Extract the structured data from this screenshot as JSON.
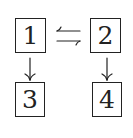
{
  "diagram": {
    "nodes": [
      {
        "id": "n1",
        "label": "1",
        "x": 15,
        "y": 18,
        "w": 31,
        "h": 35
      },
      {
        "id": "n2",
        "label": "2",
        "x": 90,
        "y": 18,
        "w": 31,
        "h": 35
      },
      {
        "id": "n3",
        "label": "3",
        "x": 15,
        "y": 82,
        "w": 30,
        "h": 35
      },
      {
        "id": "n4",
        "label": "4",
        "x": 92,
        "y": 82,
        "w": 30,
        "h": 35
      }
    ],
    "edges": [
      {
        "from": "2",
        "to": "1",
        "type": "arrow-left",
        "note": "upper arrow of ⇆"
      },
      {
        "from": "1",
        "to": "2",
        "type": "arrow-right",
        "note": "lower arrow of ⇆"
      },
      {
        "from": "1",
        "to": "3",
        "type": "arrow-down"
      },
      {
        "from": "2",
        "to": "4",
        "type": "arrow-down"
      }
    ],
    "stroke_color": "#222222"
  }
}
